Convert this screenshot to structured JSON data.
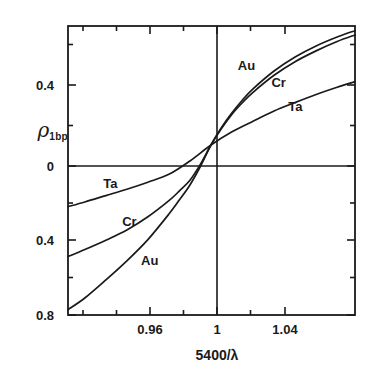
{
  "figure": {
    "background": "#ffffff",
    "ink_color": "#1a1a1a"
  },
  "chart_data": {
    "type": "line",
    "title": "",
    "subtitle": "",
    "xlabel": "5400/λ",
    "ylabel": "ρ 1bp",
    "ylabel_symbol": "ρ",
    "ylabel_subscript": "1bp",
    "xlim": [
      0.932,
      1.0685
    ],
    "ylim": [
      -0.8,
      0.56
    ],
    "grid": false,
    "legend": "inline-curve-labels",
    "xticks_major": [
      0.96,
      1.0,
      1.04
    ],
    "xticks_major_labels": [
      "0.96",
      "1",
      "1.04"
    ],
    "xticks_minor": [
      0.94,
      0.95,
      0.97,
      0.98,
      0.99,
      1.01,
      1.02,
      1.03,
      1.05,
      1.06
    ],
    "yticks_major": [
      0.4,
      0.0,
      -0.4,
      -0.8
    ],
    "yticks_major_labels": [
      "0.4",
      "0",
      "0.4",
      "0.8"
    ],
    "yticks_minor": [
      0.2,
      -0.2,
      -0.6
    ],
    "zero_line_y": 0.0,
    "zero_line_x": 1.0,
    "series": [
      {
        "name": "Au",
        "label": "Au",
        "x": [
          0.932,
          0.94,
          0.95,
          0.96,
          0.97,
          0.98,
          0.985,
          0.99,
          0.995,
          1.0,
          1.005,
          1.01,
          1.015,
          1.02,
          1.03,
          1.04,
          1.05,
          1.06,
          1.0685
        ],
        "y": [
          -0.775,
          -0.72,
          -0.635,
          -0.545,
          -0.445,
          -0.325,
          -0.258,
          -0.188,
          -0.1,
          0.0,
          0.083,
          0.152,
          0.212,
          0.264,
          0.348,
          0.414,
          0.466,
          0.508,
          0.538
        ]
      },
      {
        "name": "Cr",
        "label": "Cr",
        "x": [
          0.932,
          0.94,
          0.95,
          0.96,
          0.97,
          0.98,
          0.985,
          0.99,
          0.995,
          1.0,
          1.005,
          1.01,
          1.015,
          1.02,
          1.03,
          1.04,
          1.05,
          1.06,
          1.0685
        ],
        "y": [
          -0.525,
          -0.492,
          -0.448,
          -0.4,
          -0.338,
          -0.262,
          -0.216,
          -0.166,
          -0.09,
          0.0,
          0.078,
          0.145,
          0.2,
          0.248,
          0.328,
          0.392,
          0.443,
          0.487,
          0.518
        ]
      },
      {
        "name": "Ta",
        "label": "Ta",
        "x": [
          0.932,
          0.94,
          0.95,
          0.96,
          0.97,
          0.98,
          0.99,
          1.0,
          1.01,
          1.02,
          1.03,
          1.04,
          1.05,
          1.06,
          1.0685
        ],
        "y": [
          -0.29,
          -0.268,
          -0.238,
          -0.208,
          -0.175,
          -0.138,
          -0.075,
          0.0,
          0.062,
          0.112,
          0.16,
          0.2,
          0.238,
          0.272,
          0.298
        ]
      }
    ],
    "annotations": [
      {
        "text": "Au",
        "x": 1.018,
        "y": 0.372,
        "id": "au-upper"
      },
      {
        "text": "Cr",
        "x": 1.034,
        "y": 0.29,
        "id": "cr-upper"
      },
      {
        "text": "Ta",
        "x": 1.042,
        "y": 0.18,
        "id": "ta-upper"
      },
      {
        "text": "Ta",
        "x": 0.954,
        "y": -0.182,
        "id": "ta-lower"
      },
      {
        "text": "Cr",
        "x": 0.963,
        "y": -0.36,
        "id": "cr-lower"
      },
      {
        "text": "Au",
        "x": 0.972,
        "y": -0.545,
        "id": "au-lower"
      }
    ]
  },
  "axes": {
    "frame": {
      "left": 68,
      "top": 26,
      "right": 355,
      "bottom": 315
    },
    "ytick_positions": [
      {
        "label": "0.4",
        "y": 85
      },
      {
        "label": "0",
        "y": 166
      },
      {
        "label": "0.4",
        "y": 240
      },
      {
        "label": "0.8",
        "y": 315
      }
    ],
    "xtick_positions": [
      {
        "label": "0.96",
        "x": 150
      },
      {
        "label": "1",
        "x": 217
      },
      {
        "label": "1.04",
        "x": 285
      }
    ]
  }
}
